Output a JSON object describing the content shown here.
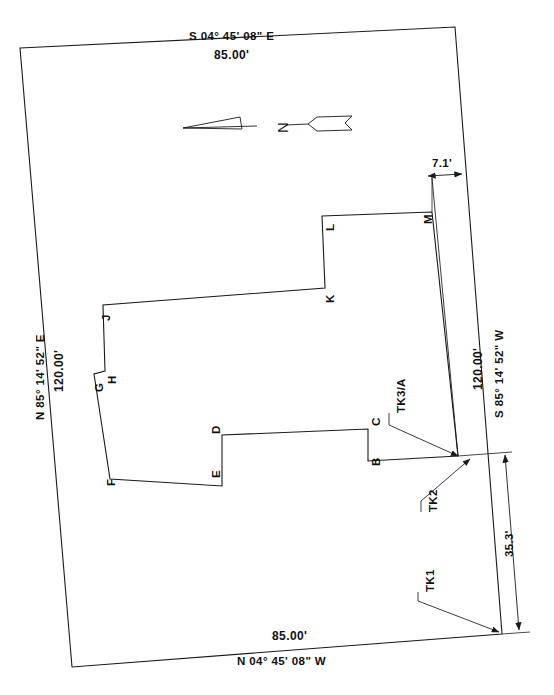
{
  "drawing": {
    "title": "Boundary Survey Plat",
    "type": "survey-plat"
  },
  "north_arrow": {
    "label": "N",
    "orientation": "pointing-right"
  },
  "boundary": {
    "sides": [
      {
        "id": "north",
        "bearing": "S 04° 45' 08\" E",
        "distance": "85.00'"
      },
      {
        "id": "west",
        "bearing": "N 85° 14' 52\" E",
        "distance": "120.00'"
      },
      {
        "id": "east",
        "bearing": "S 85° 14' 52\" W",
        "distance": "120.00'"
      },
      {
        "id": "south",
        "bearing": "N 04° 45' 08\" W",
        "distance": "85.00'"
      }
    ]
  },
  "dimensions": [
    {
      "id": "offset-top-right",
      "value": "7.1'"
    },
    {
      "id": "offset-bottom-right",
      "value": "35.3'"
    },
    {
      "id": "east-line",
      "value": "120.00'"
    }
  ],
  "building": {
    "vertices": [
      {
        "label": "A"
      },
      {
        "label": "B"
      },
      {
        "label": "C"
      },
      {
        "label": "D"
      },
      {
        "label": "E"
      },
      {
        "label": "F"
      },
      {
        "label": "G"
      },
      {
        "label": "H"
      },
      {
        "label": "J"
      },
      {
        "label": "K"
      },
      {
        "label": "L"
      },
      {
        "label": "M"
      }
    ]
  },
  "callouts": [
    {
      "id": "tk3a",
      "label": "TK3/A"
    },
    {
      "id": "tk2",
      "label": "TK2"
    },
    {
      "id": "tk1",
      "label": "TK1"
    }
  ],
  "colors": {
    "line": "#1a1a1a",
    "text": "#111111",
    "background": "#ffffff"
  }
}
